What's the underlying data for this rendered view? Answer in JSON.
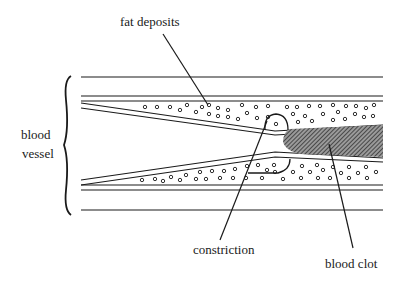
{
  "diagram": {
    "labels": {
      "fat_deposits": "fat deposits",
      "blood_vessel_line1": "blood",
      "blood_vessel_line2": "vessel",
      "constriction": "constriction",
      "blood_clot": "blood clot"
    },
    "colors": {
      "line": "#1a1a1a",
      "clot_fill": "#555555",
      "background": "#ffffff"
    }
  }
}
